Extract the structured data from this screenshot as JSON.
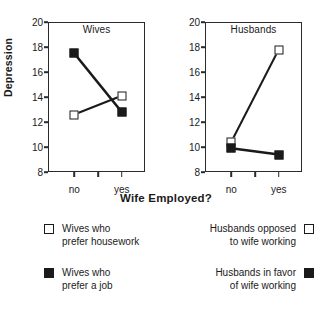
{
  "chart_data": {
    "type": "line",
    "title": "",
    "xlabel": "Wife Employed?",
    "ylabel": "Depression",
    "categories": [
      "no",
      "yes"
    ],
    "ylim": [
      8,
      20
    ],
    "yticks": [
      20,
      18,
      16,
      14,
      12,
      10,
      8
    ],
    "grid": false,
    "legend_position": "bottom",
    "panels": [
      {
        "name": "Wives",
        "series": [
          {
            "name": "Wives who\nprefer housework",
            "marker": "open-square",
            "values": [
              12.6,
              14.1
            ]
          },
          {
            "name": "Wives who\nprefer a job",
            "marker": "filled-square",
            "values": [
              17.5,
              12.8
            ]
          }
        ]
      },
      {
        "name": "Husbands",
        "series": [
          {
            "name": "Husbands opposed\nto wife working",
            "marker": "open-square",
            "values": [
              10.4,
              17.8
            ]
          },
          {
            "name": "Husbands in favor\nof wife working",
            "marker": "filled-square",
            "values": [
              9.9,
              9.4
            ]
          }
        ]
      }
    ]
  },
  "legend": {
    "items": [
      {
        "label": "Wives who\nprefer housework",
        "marker": "open-square"
      },
      {
        "label": "Wives who\nprefer a job",
        "marker": "filled-square"
      },
      {
        "label": "Husbands opposed\nto wife working",
        "marker": "open-square"
      },
      {
        "label": "Husbands in favor\nof wife working",
        "marker": "filled-square"
      }
    ]
  },
  "colors": {
    "ink": "#1a1a1a",
    "axis": "#2b2b2b",
    "background": "#ffffff"
  }
}
